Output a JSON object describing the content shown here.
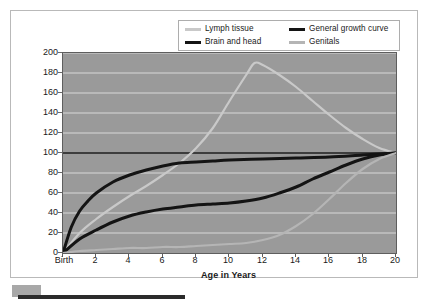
{
  "chart_data": {
    "type": "line",
    "title": "",
    "xlabel": "Age in Years",
    "ylabel": "Size in Terms of Percentage of Total Growth",
    "xlim": [
      0,
      20
    ],
    "ylim": [
      0,
      200
    ],
    "grid": true,
    "grid_orientation": "horizontal",
    "legend_position": "top-right",
    "plot_background": "#9a9a9a",
    "gridline_color": "#d8d8d8",
    "x_tick_labels": [
      "Birth",
      "2",
      "4",
      "6",
      "8",
      "10",
      "12",
      "14",
      "16",
      "18",
      "20"
    ],
    "x_tick_values": [
      0,
      2,
      4,
      6,
      8,
      10,
      12,
      14,
      16,
      18,
      20
    ],
    "y_tick_labels": [
      "0",
      "20",
      "40",
      "60",
      "80",
      "100",
      "120",
      "140",
      "160",
      "180",
      "200"
    ],
    "y_tick_values": [
      0,
      20,
      40,
      60,
      80,
      100,
      120,
      140,
      160,
      180,
      200
    ],
    "series": [
      {
        "name": "Lymph tissue",
        "color": "#c9c9c9",
        "x": [
          0,
          1,
          2,
          3,
          4,
          5,
          6,
          7,
          8,
          9,
          10,
          11,
          11.5,
          12,
          13,
          14,
          15,
          16,
          17,
          18,
          19,
          20
        ],
        "values": [
          0,
          20,
          34,
          46,
          57,
          67,
          78,
          90,
          105,
          125,
          152,
          178,
          190,
          188,
          178,
          166,
          152,
          138,
          125,
          114,
          105,
          100
        ]
      },
      {
        "name": "Brain and head",
        "color": "#141414",
        "x": [
          0,
          0.5,
          1,
          1.5,
          2,
          3,
          4,
          5,
          6,
          7,
          8,
          9,
          10,
          12,
          14,
          16,
          18,
          20
        ],
        "values": [
          0,
          26,
          42,
          52,
          60,
          71,
          78,
          83,
          87,
          90,
          91,
          92,
          93,
          94,
          95,
          96,
          98,
          100
        ]
      },
      {
        "name": "General growth curve",
        "color": "#141414",
        "x": [
          0,
          1,
          2,
          3,
          4,
          5,
          6,
          7,
          8,
          9,
          10,
          11,
          12,
          13,
          14,
          15,
          16,
          17,
          18,
          19,
          20
        ],
        "values": [
          0,
          14,
          23,
          31,
          37,
          41,
          44,
          46,
          48,
          49,
          50,
          52,
          55,
          60,
          66,
          74,
          81,
          88,
          94,
          98,
          100
        ]
      },
      {
        "name": "Genitals",
        "color": "#b5b5b5",
        "x": [
          0,
          1,
          2,
          3,
          4,
          5,
          6,
          7,
          8,
          9,
          10,
          11,
          12,
          13,
          14,
          15,
          16,
          17,
          18,
          19,
          20
        ],
        "values": [
          0,
          2,
          3,
          4,
          5,
          5,
          6,
          6,
          7,
          8,
          9,
          10,
          13,
          18,
          27,
          39,
          54,
          70,
          84,
          94,
          100
        ]
      }
    ],
    "reference_lines": [
      {
        "name": "hundred-percent-line",
        "y": 100,
        "color": "#141414"
      }
    ]
  },
  "legend": {
    "entries": [
      {
        "label": "Lymph tissue",
        "color": "#c9c9c9"
      },
      {
        "label": "General growth curve",
        "color": "#141414"
      },
      {
        "label": "Brain and head",
        "color": "#141414"
      },
      {
        "label": "Genitals",
        "color": "#b5b5b5"
      }
    ]
  },
  "axes": {
    "x_title": "Age in Years",
    "y_title": "Size in Terms of Percentage of Total Growth"
  }
}
